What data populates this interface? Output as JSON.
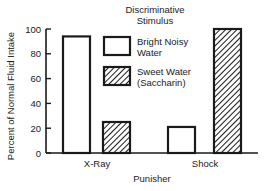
{
  "chart_data": {
    "type": "bar",
    "title": "",
    "legend_title": [
      "Discriminative",
      "Stimulus"
    ],
    "xlabel": "Punisher",
    "ylabel": "Percent of Normal Fluid Intake",
    "ylim": [
      0,
      100
    ],
    "yticks": [
      0,
      20,
      40,
      60,
      80,
      100
    ],
    "grid": false,
    "legend_position": "upper center (inside plot)",
    "categories": [
      "X-Ray",
      "Shock"
    ],
    "series": [
      {
        "name": "Bright Noisy Water",
        "label_lines": [
          "Bright Noisy",
          "Water"
        ],
        "fill": "white",
        "values": [
          94,
          21
        ]
      },
      {
        "name": "Sweet Water (Saccharin)",
        "label_lines": [
          "Sweet Water",
          "(Saccharin)"
        ],
        "fill": "hatched",
        "values": [
          25,
          100
        ]
      }
    ]
  },
  "colors": {
    "ink": "#1a1a1a",
    "background": "#ffffff"
  }
}
